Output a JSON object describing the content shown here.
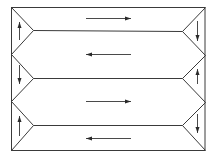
{
  "diagram": {
    "type": "serpentine-flow-channel",
    "stroke_color": "#3a3a3a",
    "frame": {
      "x1": 11,
      "y1": 7,
      "x2": 205,
      "y2": 150
    },
    "left_vertices": [
      [
        11,
        7
      ],
      [
        11,
        54
      ],
      [
        11,
        101
      ],
      [
        11,
        150
      ]
    ],
    "right_vertices": [
      [
        205,
        7
      ],
      [
        205,
        55
      ],
      [
        205,
        102
      ],
      [
        205,
        150
      ]
    ],
    "inner_left": [
      [
        33,
        30
      ],
      [
        33,
        78
      ],
      [
        33,
        125
      ]
    ],
    "inner_right": [
      [
        182,
        31
      ],
      [
        182,
        78
      ],
      [
        182,
        125
      ]
    ],
    "horizontal_arrows": [
      {
        "y": 18,
        "x_from": 86,
        "x_to": 131,
        "direction": "right"
      },
      {
        "y": 54,
        "x_from": 131,
        "x_to": 86,
        "direction": "left"
      },
      {
        "y": 101,
        "x_from": 86,
        "x_to": 131,
        "direction": "right"
      },
      {
        "y": 138,
        "x_from": 131,
        "x_to": 86,
        "direction": "left"
      }
    ],
    "vertical_arrows": [
      {
        "side": "left",
        "x": 19,
        "y_from": 40,
        "y_to": 22,
        "direction": "up"
      },
      {
        "side": "left",
        "x": 19,
        "y_from": 65,
        "y_to": 84,
        "direction": "down"
      },
      {
        "side": "left",
        "x": 19,
        "y_from": 136,
        "y_to": 116,
        "direction": "up"
      },
      {
        "side": "right",
        "x": 197,
        "y_from": 21,
        "y_to": 41,
        "direction": "down"
      },
      {
        "side": "right",
        "x": 197,
        "y_from": 84,
        "y_to": 69,
        "direction": "up"
      },
      {
        "side": "right",
        "x": 197,
        "y_from": 114,
        "y_to": 133,
        "direction": "down"
      }
    ]
  }
}
